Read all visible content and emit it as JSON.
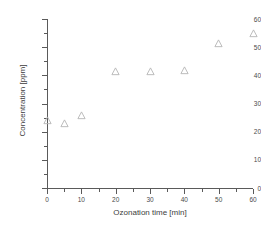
{
  "chart_data": {
    "type": "scatter",
    "title": "",
    "xlabel": "Ozonation time [min]",
    "ylabel": "Concentration [ppm]",
    "xlim": [
      0,
      60
    ],
    "ylim": [
      0,
      60
    ],
    "xticks": [
      0,
      10,
      20,
      30,
      40,
      50,
      60
    ],
    "yticks": [
      0,
      10,
      20,
      30,
      40,
      50,
      60
    ],
    "xtick_labels": [
      "0",
      "10",
      "20",
      "30",
      "40",
      "50",
      "60"
    ],
    "ytick_labels": [
      "0",
      "10",
      "20",
      "30",
      "40",
      "50",
      "60"
    ],
    "minor_ticks": true,
    "grid": false,
    "legend": null,
    "marker": "open-triangle-up",
    "marker_color": "#b4b4b4",
    "series": [
      {
        "name": "Concentration",
        "x": [
          0,
          5,
          10,
          20,
          30,
          40,
          50,
          60
        ],
        "y": [
          23.8,
          22.9,
          25.6,
          41.5,
          41.5,
          41.6,
          51.4,
          54.8
        ]
      }
    ]
  },
  "colors": {
    "axis": "#5a5a5a",
    "text": "#3c3c3c",
    "marker": "#b4b4b4",
    "background": "#ffffff"
  }
}
